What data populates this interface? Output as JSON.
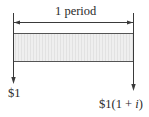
{
  "diagram": {
    "type": "cash-flow-diagram",
    "period_label": "1 period",
    "start_cash_flow": {
      "label": "$1",
      "direction": "down"
    },
    "end_cash_flow": {
      "label_prefix": "$1(1 + ",
      "label_var": "i",
      "label_suffix": ")",
      "full_label": "$1(1 + i)",
      "direction": "down"
    },
    "colors": {
      "line": "#3a3a3a",
      "box_fill": "#ececec",
      "box_border": "#555555",
      "hatch": "#e0e0e0"
    }
  }
}
